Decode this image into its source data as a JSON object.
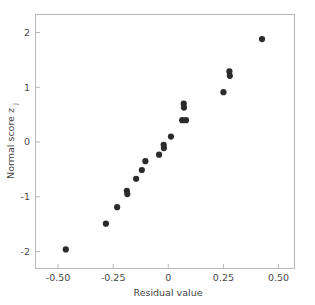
{
  "chart_data": {
    "type": "scatter",
    "title": "",
    "xlabel": "Residual value",
    "ylabel": "Normal score z",
    "ylabel_subscript": "j",
    "xlim": [
      -0.6,
      0.57
    ],
    "ylim": [
      -2.3,
      2.32
    ],
    "xticks": [
      -0.5,
      -0.25,
      0,
      0.25,
      0.5
    ],
    "xticklabels": [
      "-0.50",
      "-0.25",
      "0",
      "0.25",
      "0.50"
    ],
    "yticks": [
      2,
      1,
      0,
      -1,
      -2
    ],
    "yticklabels": [
      "2",
      "1",
      "0",
      "-1",
      "-2"
    ],
    "grid": false,
    "legend": null,
    "marker": "circle",
    "marker_color": "#2b2b2b",
    "marker_size_px": 3.1,
    "points": [
      {
        "x": -0.465,
        "y": -1.96
      },
      {
        "x": -0.283,
        "y": -1.49
      },
      {
        "x": -0.232,
        "y": -1.19
      },
      {
        "x": -0.188,
        "y": -0.89
      },
      {
        "x": -0.186,
        "y": -0.95
      },
      {
        "x": -0.146,
        "y": -0.67
      },
      {
        "x": -0.12,
        "y": -0.51
      },
      {
        "x": -0.104,
        "y": -0.35
      },
      {
        "x": -0.042,
        "y": -0.23
      },
      {
        "x": -0.021,
        "y": -0.05
      },
      {
        "x": -0.02,
        "y": -0.11
      },
      {
        "x": 0.012,
        "y": 0.1
      },
      {
        "x": 0.07,
        "y": 0.7
      },
      {
        "x": 0.071,
        "y": 0.63
      },
      {
        "x": 0.063,
        "y": 0.4
      },
      {
        "x": 0.08,
        "y": 0.4
      },
      {
        "x": 0.25,
        "y": 0.91
      },
      {
        "x": 0.277,
        "y": 1.29
      },
      {
        "x": 0.279,
        "y": 1.21
      },
      {
        "x": 0.425,
        "y": 1.88
      }
    ]
  },
  "figure": {
    "background": "#ffffff",
    "frame_color": "#b9b9b9",
    "text_color": "#3f3f3f"
  }
}
